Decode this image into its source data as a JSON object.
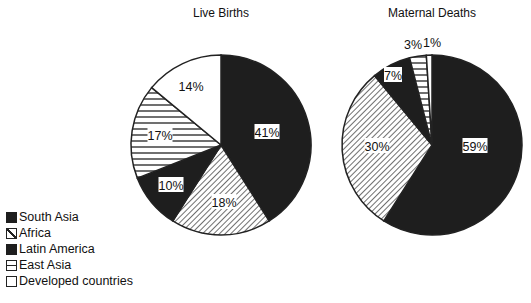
{
  "chart_data": [
    {
      "type": "pie",
      "title": "Live Births",
      "categories": [
        "South Asia",
        "Africa",
        "Latin America",
        "East Asia",
        "Developed countries"
      ],
      "values": [
        41,
        18,
        10,
        17,
        14
      ],
      "labels": [
        "41%",
        "18%",
        "10%",
        "17%",
        "14%"
      ],
      "start_angle": "12 o'clock, clockwise"
    },
    {
      "type": "pie",
      "title": "Maternal Deaths",
      "categories": [
        "South Asia",
        "Africa",
        "Latin America",
        "East Asia",
        "Developed countries"
      ],
      "values": [
        59,
        30,
        7,
        3,
        1
      ],
      "labels": [
        "59%",
        "30%",
        "7%",
        "3%",
        "1%"
      ],
      "start_angle": "12 o'clock, clockwise"
    }
  ],
  "legend": {
    "position": "bottom-left",
    "items": [
      {
        "label": "South Asia",
        "pattern": "solid-dark"
      },
      {
        "label": "Africa",
        "pattern": "diagonal-hatch"
      },
      {
        "label": "Latin America",
        "pattern": "solid-dark"
      },
      {
        "label": "East Asia",
        "pattern": "horizontal-lines"
      },
      {
        "label": "Developed countries",
        "pattern": "white"
      }
    ]
  },
  "colors": {
    "dark": "#1e1e1e",
    "line": "#222222",
    "background": "#ffffff"
  }
}
